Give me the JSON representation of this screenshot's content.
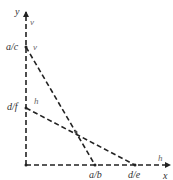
{
  "diagram": {
    "axes": {
      "x_label": "x",
      "y_label": "y"
    },
    "tick_labels": {
      "y_upper": "a/c",
      "y_lower": "d/f",
      "x_left": "a/b",
      "x_right": "d/e"
    },
    "line_labels": {
      "v_on_axis": "v",
      "v_at_intercept": "v",
      "h_at_intercept": "h",
      "h_on_axis": "h"
    },
    "lines": [
      {
        "name": "v",
        "from": "a/c on y-axis",
        "to": "a/b on x-axis",
        "style": "dashed"
      },
      {
        "name": "h",
        "from": "d/f on y-axis",
        "to": "d/e on x-axis",
        "style": "dashed"
      }
    ],
    "colors": {
      "line": "#222222",
      "label": "#333333"
    }
  }
}
